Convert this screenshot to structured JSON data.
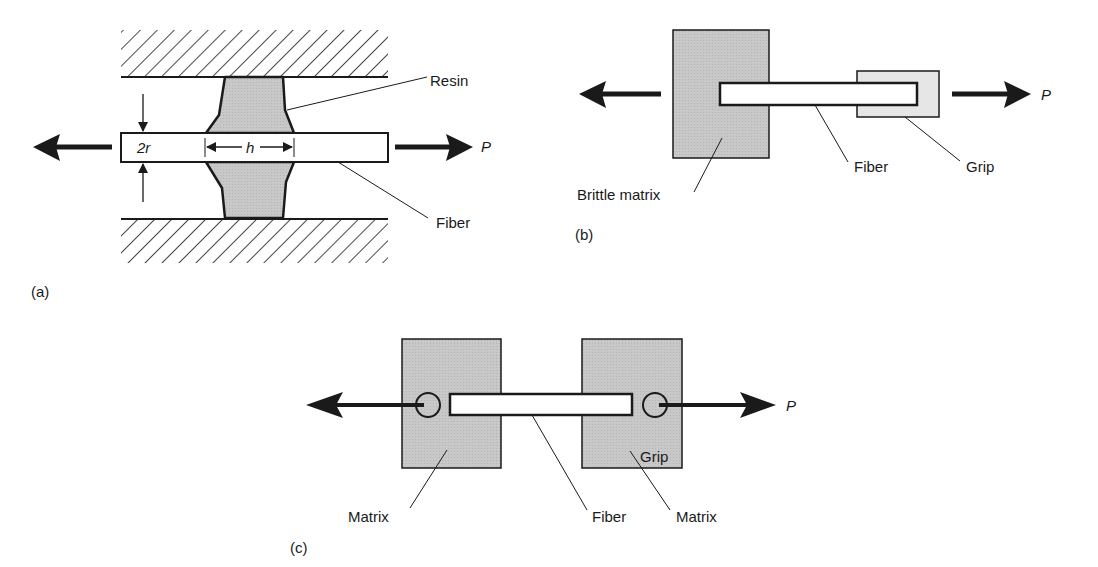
{
  "colors": {
    "ink": "#1a1a1a",
    "matrix_fill": "#c8c8c8",
    "grip_fill": "#e6e6e6",
    "fiber_fill": "#ffffff"
  },
  "panel_a": {
    "tag": "(a)",
    "resin_label": "Resin",
    "fiber_label": "Fiber",
    "diameter_label": "2r",
    "length_label": "h",
    "load_label": "P"
  },
  "panel_b": {
    "tag": "(b)",
    "matrix_label": "Brittle matrix",
    "fiber_label": "Fiber",
    "grip_label": "Grip",
    "load_label": "P"
  },
  "panel_c": {
    "tag": "(c)",
    "left_matrix_label": "Matrix",
    "fiber_label": "Fiber",
    "right_matrix_label": "Matrix",
    "grip_label": "Grip",
    "load_label": "P"
  }
}
